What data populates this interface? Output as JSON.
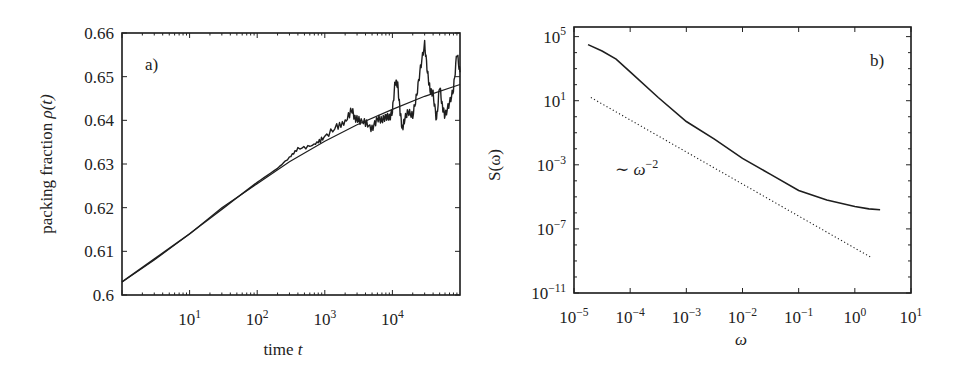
{
  "chart_data": [
    {
      "panel": "a)",
      "type": "line",
      "title": "",
      "xlabel": "time t",
      "ylabel": "packing fraction ρ(t)",
      "xscale": "log",
      "xlim": [
        1,
        100000
      ],
      "ylim": [
        0.6,
        0.66
      ],
      "xticks": [
        {
          "label": "10",
          "exp": "1",
          "value": 10
        },
        {
          "label": "10",
          "exp": "2",
          "value": 100
        },
        {
          "label": "10",
          "exp": "3",
          "value": 1000
        },
        {
          "label": "10",
          "exp": "4",
          "value": 10000
        }
      ],
      "yticks": [
        {
          "label": "0.6",
          "value": 0.6
        },
        {
          "label": "0.61",
          "value": 0.61
        },
        {
          "label": "0.62",
          "value": 0.62
        },
        {
          "label": "0.63",
          "value": 0.63
        },
        {
          "label": "0.64",
          "value": 0.64
        },
        {
          "label": "0.65",
          "value": 0.65
        },
        {
          "label": "0.66",
          "value": 0.66
        }
      ],
      "grid": false,
      "legend": null,
      "series": [
        {
          "name": "fit",
          "style": "solid-thin",
          "x": [
            1,
            3,
            10,
            30,
            100,
            300,
            1000,
            3000,
            10000,
            30000,
            100000
          ],
          "y": [
            0.603,
            0.608,
            0.614,
            0.62,
            0.6255,
            0.6305,
            0.6352,
            0.639,
            0.6425,
            0.6455,
            0.6482
          ]
        },
        {
          "name": "simulation data",
          "style": "solid-noisy",
          "x": [
            1,
            10,
            100,
            200,
            300,
            400,
            600,
            800,
            1000,
            1500,
            2000,
            2500,
            2800,
            3200,
            4000,
            5000,
            6000,
            7000,
            8000,
            9000,
            10000,
            11000,
            12000,
            13000,
            14000,
            15000,
            17000,
            20000,
            23000,
            26000,
            30000,
            33000,
            36000,
            40000,
            45000,
            50000,
            55000,
            60000,
            70000,
            80000,
            90000,
            100000
          ],
          "y": [
            0.603,
            0.614,
            0.6258,
            0.629,
            0.6315,
            0.6335,
            0.634,
            0.635,
            0.6362,
            0.6385,
            0.6395,
            0.6425,
            0.6405,
            0.64,
            0.6395,
            0.638,
            0.6405,
            0.64,
            0.641,
            0.6405,
            0.642,
            0.649,
            0.648,
            0.642,
            0.638,
            0.64,
            0.642,
            0.641,
            0.646,
            0.652,
            0.6575,
            0.651,
            0.647,
            0.646,
            0.64,
            0.648,
            0.643,
            0.641,
            0.644,
            0.647,
            0.6555,
            0.651
          ]
        }
      ],
      "annotations": [
        {
          "text": "a)",
          "position": "top-left"
        }
      ]
    },
    {
      "panel": "b)",
      "type": "line",
      "title": "",
      "xlabel": "ω",
      "ylabel": "S(ω)",
      "xscale": "log",
      "yscale": "log",
      "xlim": [
        1e-05,
        10
      ],
      "ylim": [
        1e-11,
        100000.0
      ],
      "xticks": [
        {
          "label": "10",
          "exp": "−5",
          "value": -5
        },
        {
          "label": "10",
          "exp": "−4",
          "value": -4
        },
        {
          "label": "10",
          "exp": "−3",
          "value": -3
        },
        {
          "label": "10",
          "exp": "−2",
          "value": -2
        },
        {
          "label": "10",
          "exp": "−1",
          "value": -1
        },
        {
          "label": "10",
          "exp": "0",
          "value": 0
        },
        {
          "label": "10",
          "exp": "1",
          "value": 1
        }
      ],
      "yticks": [
        {
          "label": "10",
          "exp": "5",
          "value": 5
        },
        {
          "label": "10",
          "exp": "1",
          "value": 1
        },
        {
          "label": "10",
          "exp": "−3",
          "value": -3
        },
        {
          "label": "10",
          "exp": "−7",
          "value": -7
        },
        {
          "label": "10",
          "exp": "−11",
          "value": -11
        }
      ],
      "grid": false,
      "legend": null,
      "series": [
        {
          "name": "S(ω) spectrum",
          "style": "solid",
          "log10_x": [
            -4.75,
            -4.5,
            -4.25,
            -4.0,
            -3.5,
            -3.0,
            -2.5,
            -2.0,
            -1.5,
            -1.0,
            -0.5,
            0.0,
            0.25,
            0.45
          ],
          "log10_y": [
            4.5,
            4.1,
            3.6,
            2.8,
            1.2,
            -0.3,
            -1.4,
            -2.6,
            -3.6,
            -4.6,
            -5.2,
            -5.6,
            -5.75,
            -5.8
          ]
        },
        {
          "name": "~ω^-2 reference",
          "style": "dotted",
          "log10_x": [
            -4.7,
            0.3
          ],
          "log10_y": [
            1.2,
            -8.8
          ]
        }
      ],
      "annotations": [
        {
          "text": "b)",
          "position": "top-right"
        },
        {
          "text": "∼ ω",
          "exp": "−2",
          "position": "mid-left"
        }
      ]
    }
  ]
}
